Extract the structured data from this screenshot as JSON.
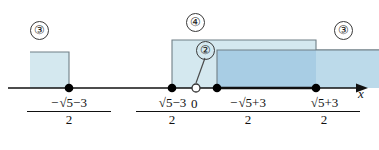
{
  "figure": {
    "type": "number-line-interval-diagram",
    "axis_label": "x",
    "origin_label": "0",
    "colors": {
      "band_light": "#d4e8ef",
      "band_dark": "#a8cde4",
      "band_border": "#6f7f86",
      "axis": "#111111",
      "point": "#000000",
      "open_point_fill": "#ffffff"
    }
  },
  "ticks": [
    {
      "id": "t1",
      "numerator": "−√5 −3",
      "denominator": "2",
      "x": 69,
      "type": "closed"
    },
    {
      "id": "t2",
      "numerator": "√5 −3",
      "denominator": "2",
      "x": 172,
      "type": "closed"
    },
    {
      "id": "t0",
      "numerator": "0",
      "denominator": "",
      "x": 196,
      "type": "open"
    },
    {
      "id": "t3",
      "numerator": "−√5 +3",
      "denominator": "2",
      "x": 217,
      "type": "closed"
    },
    {
      "id": "t4",
      "numerator": "√5 +3",
      "denominator": "2",
      "x": 316,
      "type": "closed"
    }
  ],
  "bands": [
    {
      "id": "b-left",
      "label": "③",
      "shade": "light",
      "from_x": 30,
      "to_x": 69,
      "top_y": 52
    },
    {
      "id": "b-four",
      "label": "④",
      "shade": "light",
      "from_x": 172,
      "to_x": 316,
      "top_y": 40
    },
    {
      "id": "b-two",
      "label": "②",
      "shade": "dark",
      "from_x": 217,
      "to_x": 379,
      "top_y": 50
    },
    {
      "id": "b-right",
      "label": "③",
      "shade": "light",
      "from_x": 316,
      "to_x": 379,
      "top_y": 50
    }
  ],
  "callouts": [
    {
      "id": "c-left",
      "text": "③",
      "x": 38,
      "y": 29
    },
    {
      "id": "c-four",
      "text": "④",
      "x": 186,
      "y": 21
    },
    {
      "id": "c-two",
      "text": "②",
      "x": 197,
      "y": 44
    },
    {
      "id": "c-right",
      "text": "③",
      "x": 337,
      "y": 29
    }
  ],
  "fraction_labels": {
    "f1": {
      "num_sign": "−",
      "num_root": "5",
      "num_tail": "−3",
      "den": "2",
      "cx": 69
    },
    "f2": {
      "num_sign": "",
      "num_root": "5",
      "num_tail": "−3",
      "den": "2",
      "cx": 172
    },
    "f3": {
      "num_sign": "−",
      "num_root": "5",
      "num_tail": "+3",
      "den": "2",
      "cx": 228
    },
    "f4": {
      "num_sign": "",
      "num_root": "5",
      "num_tail": "+3",
      "den": "2",
      "cx": 316
    }
  }
}
